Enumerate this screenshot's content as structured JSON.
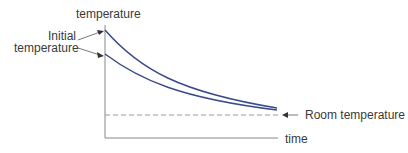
{
  "diagram": {
    "y_axis_label": "temperature",
    "x_axis_label": "time",
    "initial_label_line1": "Initial",
    "initial_label_line2": "temperature",
    "room_label": "Room temperature",
    "curve_color": "#3a4a8c",
    "axis_color": "#888888",
    "dashed_color": "#999999"
  }
}
